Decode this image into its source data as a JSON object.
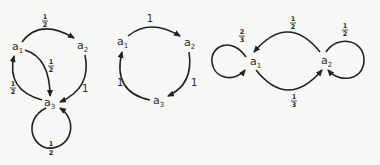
{
  "diagrams": [
    {
      "id": "graph-1",
      "nodes": [
        {
          "label": "a",
          "sub": "1"
        },
        {
          "label": "a",
          "sub": "2"
        },
        {
          "label": "a",
          "sub": "3"
        }
      ],
      "edges": [
        {
          "from": "a1",
          "to": "a2",
          "weight": {
            "n": "1",
            "d": "2"
          }
        },
        {
          "from": "a1",
          "to": "a3",
          "weight": {
            "n": "1",
            "d": "2"
          }
        },
        {
          "from": "a2",
          "to": "a3",
          "weight": "1"
        },
        {
          "from": "a3",
          "to": "a1",
          "weight": {
            "n": "1",
            "d": "2"
          }
        },
        {
          "from": "a3",
          "to": "a3",
          "weight": {
            "n": "1",
            "d": "2"
          }
        }
      ]
    },
    {
      "id": "graph-2",
      "nodes": [
        {
          "label": "a",
          "sub": "1"
        },
        {
          "label": "a",
          "sub": "2"
        },
        {
          "label": "a",
          "sub": "3"
        }
      ],
      "edges": [
        {
          "from": "a1",
          "to": "a2",
          "weight": "1"
        },
        {
          "from": "a2",
          "to": "a3",
          "weight": "1"
        },
        {
          "from": "a3",
          "to": "a1",
          "weight": "1"
        }
      ]
    },
    {
      "id": "graph-3",
      "nodes": [
        {
          "label": "a",
          "sub": "1"
        },
        {
          "label": "a",
          "sub": "2"
        }
      ],
      "edges": [
        {
          "from": "a1",
          "to": "a1",
          "weight": {
            "n": "2",
            "d": "3"
          }
        },
        {
          "from": "a2",
          "to": "a1",
          "weight": {
            "n": "1",
            "d": "2"
          }
        },
        {
          "from": "a1",
          "to": "a2",
          "weight": {
            "n": "1",
            "d": "3"
          }
        },
        {
          "from": "a2",
          "to": "a2",
          "weight": {
            "n": "1",
            "d": "2"
          }
        }
      ]
    }
  ]
}
